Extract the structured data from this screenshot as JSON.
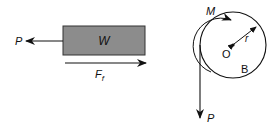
{
  "left_figure": {
    "block_label": "W",
    "pull_force_label": "P",
    "friction_label_main": "F",
    "friction_label_sub": "f",
    "block_color": "#8c8c8c"
  },
  "right_figure": {
    "moment_label": "M",
    "center_label": "O",
    "radius_label": "r",
    "body_label": "B",
    "hanging_force_label": "P"
  }
}
